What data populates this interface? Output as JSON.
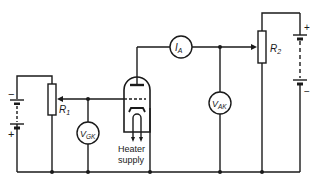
{
  "diagram": {
    "type": "circuit",
    "components": {
      "anode_ammeter": {
        "symbol": "I",
        "subscript": "A"
      },
      "anode_voltmeter": {
        "symbol": "V",
        "subscript": "AK"
      },
      "grid_voltmeter": {
        "symbol": "V",
        "subscript": "GK"
      },
      "anode_potentiometer": {
        "symbol": "R",
        "subscript": "2"
      },
      "grid_potentiometer": {
        "symbol": "R",
        "subscript": "1"
      },
      "grid_battery": {
        "plus": "+",
        "minus": "−"
      },
      "anode_battery": {
        "plus": "+",
        "minus": "−"
      },
      "heater": {
        "line1": "Heater",
        "line2": "supply"
      }
    },
    "colors": {
      "line": "#1a1a1a",
      "background": "#ffffff"
    }
  }
}
